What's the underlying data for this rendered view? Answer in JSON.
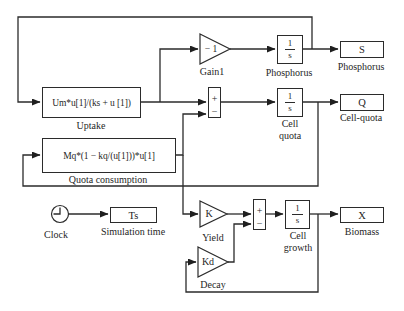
{
  "diagram": {
    "blocks": {
      "uptake": {
        "expression": "Um*u[1]/(ks + u [1])",
        "label": "Uptake"
      },
      "quota_consumption": {
        "expression": "Mq*(1 − kq/(u[1]))*u[1]",
        "label": "Quota consumption"
      },
      "gain1": {
        "gain": "− 1",
        "label": "Gain1"
      },
      "phosphorus_integrator": {
        "numerator": "1",
        "denominator": "s",
        "label": "Phosphorus"
      },
      "cell_quota_integrator": {
        "numerator": "1",
        "denominator": "s",
        "label_line1": "Cell",
        "label_line2": "quota"
      },
      "cell_growth_integrator": {
        "numerator": "1",
        "denominator": "s",
        "label_line1": "Cell",
        "label_line2": "growth"
      },
      "quota_sum": {
        "plus": "+",
        "minus": "−"
      },
      "growth_sum": {
        "plus": "+",
        "minus": "−"
      },
      "yield_gain": {
        "gain": "K",
        "label": "Yield"
      },
      "decay_gain": {
        "gain": "Kd",
        "label": "Decay"
      },
      "clock": {
        "label": "Clock"
      },
      "simulation_time": {
        "value": "Ts",
        "label": "Simulation time"
      },
      "phosphorus_outport": {
        "value": "S",
        "label": "Phosphorus"
      },
      "cell_quota_outport": {
        "value": "Q",
        "label": "Cell-quota"
      },
      "biomass_outport": {
        "value": "X",
        "label": "Biomass"
      }
    },
    "colors": {
      "line": "#2b2b2b",
      "text": "#1f1f1f",
      "background": "#ffffff"
    }
  }
}
